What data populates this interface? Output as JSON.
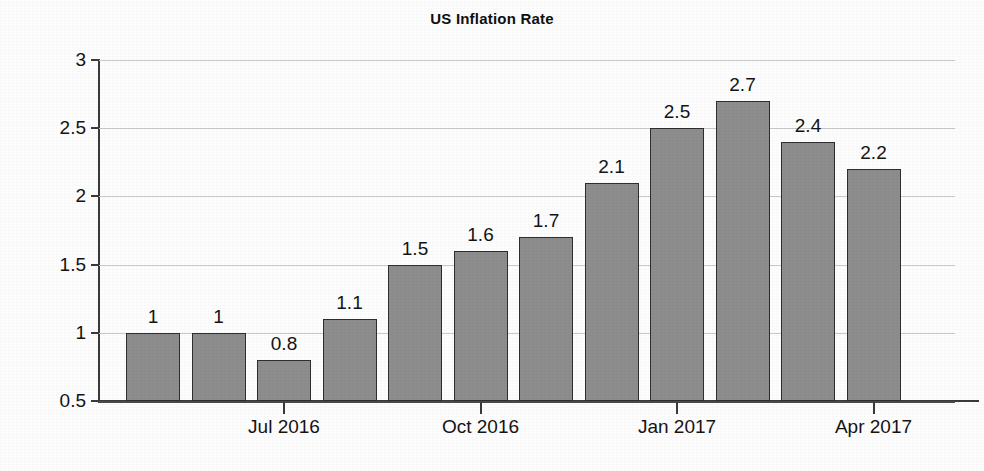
{
  "chart_data": {
    "type": "bar",
    "title": "US Inflation Rate",
    "xlabel": "",
    "ylabel": "",
    "ylim": [
      0.5,
      3
    ],
    "yticks": [
      0.5,
      1,
      1.5,
      2,
      2.5,
      3
    ],
    "ytick_labels": [
      "0.5",
      "1",
      "1.5",
      "2",
      "2.5",
      "3"
    ],
    "grid": true,
    "legend": "none",
    "bar_color": "#8d8d8d",
    "bar_edge_color": "#2e2e2e",
    "values": [
      1,
      1,
      0.8,
      1.1,
      1.5,
      1.6,
      1.7,
      2.1,
      2.5,
      2.7,
      2.4,
      2.2
    ],
    "value_labels": [
      "1",
      "1",
      "0.8",
      "1.1",
      "1.5",
      "1.6",
      "1.7",
      "2.1",
      "2.5",
      "2.7",
      "2.4",
      "2.2"
    ],
    "categories": [
      "",
      "",
      "Jul 2016",
      "",
      "",
      "Oct 2016",
      "",
      "",
      "Jan 2017",
      "",
      "",
      "Apr 2017"
    ],
    "xtick_labels": [
      "Jul 2016",
      "Oct 2016",
      "Jan 2017",
      "Apr 2017"
    ],
    "xtick_bar_indices": [
      2,
      5,
      8,
      11
    ]
  }
}
